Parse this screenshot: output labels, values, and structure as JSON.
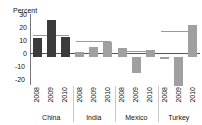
{
  "chart_data": {
    "type": "bar",
    "title": "",
    "subtitle": "",
    "unit_label": "Percent",
    "ylabel": "Percent",
    "xlabel": "",
    "ylim": [
      -20,
      30
    ],
    "yticks": [
      "30",
      "20",
      "10",
      "0",
      "-10",
      "-20"
    ],
    "ytick_values": [
      30,
      20,
      10,
      0,
      -10,
      -20
    ],
    "grid": false,
    "legend": "none",
    "categories": [
      "2008",
      "2009",
      "2010"
    ],
    "groups": [
      {
        "name": "China",
        "color": "#3b3b3b",
        "values": [
          13,
          26,
          14
        ],
        "reference_line": 15
      },
      {
        "name": "India",
        "color": "#a0a0a0",
        "values": [
          3,
          7,
          10.5
        ],
        "reference_line": 11
      },
      {
        "name": "Mexico",
        "color": "#a0a0a0",
        "values": [
          6,
          -11.5,
          4.5
        ],
        "reference_line": 4
      },
      {
        "name": "Turkey",
        "color": "#a0a0a0",
        "values": [
          -1.5,
          -20.5,
          22
        ],
        "reference_line": 18
      }
    ]
  },
  "axis": {
    "unit": "Percent",
    "tick_30": "30",
    "tick_20": "20",
    "tick_10": "10",
    "tick_0": "0",
    "tick_neg10": "-10",
    "tick_neg20": "-20"
  }
}
